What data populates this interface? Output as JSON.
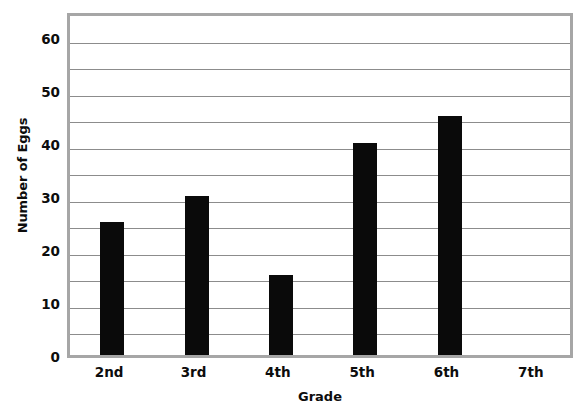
{
  "chart_data": {
    "type": "bar",
    "title": "",
    "xlabel": "Grade",
    "ylabel": "Number of Eggs",
    "categories": [
      "2nd",
      "3rd",
      "4th",
      "5th",
      "6th",
      "7th"
    ],
    "values": [
      25,
      30,
      15,
      40,
      45,
      0
    ],
    "series": [
      {
        "name": "Number of Eggs",
        "values": [
          25,
          30,
          15,
          40,
          45,
          0
        ]
      }
    ],
    "ylim": [
      0,
      65
    ],
    "y_tick_labels": [
      "0",
      "10",
      "20",
      "30",
      "40",
      "50",
      "60"
    ],
    "y_tick_values": [
      0,
      10,
      20,
      30,
      40,
      50,
      60
    ],
    "gridline_values": [
      5,
      10,
      15,
      20,
      25,
      30,
      35,
      40,
      45,
      50,
      55,
      60
    ],
    "grid": true,
    "legend": false,
    "bar_color": "#0a0a0a",
    "grid_color": "#8c8c8c",
    "border_color": "#a6a6a6",
    "background_color": "#ffffff"
  }
}
